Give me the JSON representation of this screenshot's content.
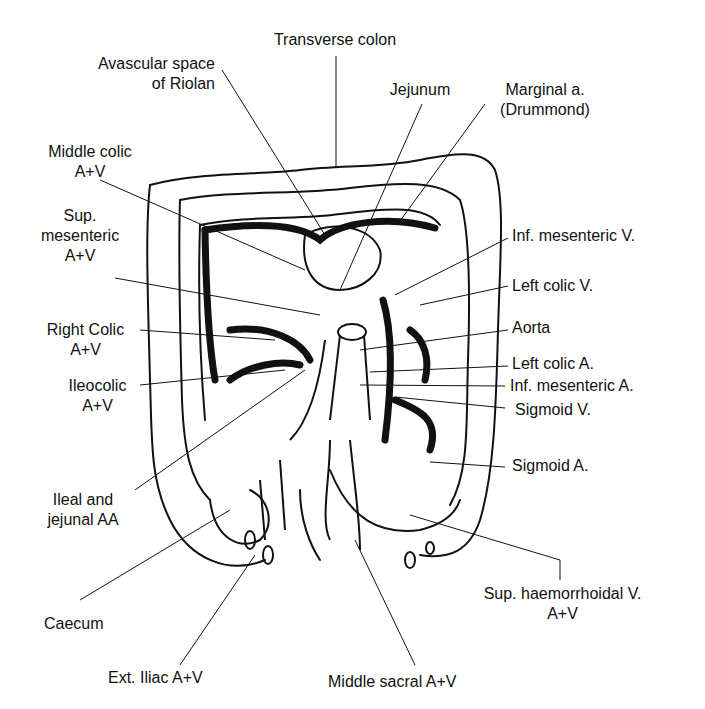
{
  "labels": {
    "transverse_colon": "Transverse colon",
    "avascular_space": [
      "Avascular space",
      "of Riolan"
    ],
    "jejunum": "Jejunum",
    "marginal_a": [
      "Marginal a.",
      "(Drummond)"
    ],
    "middle_colic": [
      "Middle colic",
      "A+V"
    ],
    "sup_mesenteric": [
      "Sup.",
      "mesenteric",
      "A+V"
    ],
    "right_colic": [
      "Right Colic",
      "A+V"
    ],
    "ileocolic": [
      "Ileocolic",
      "A+V"
    ],
    "ileal_jejunal": [
      "Ileal and",
      "jejunal AA"
    ],
    "caecum": "Caecum",
    "ext_iliac": "Ext. Iliac A+V",
    "middle_sacral": "Middle sacral A+V",
    "sup_haemorrhoidal": [
      "Sup. haemorrhoidal V.",
      "A+V"
    ],
    "inf_mesenteric_v": "Inf. mesenteric V.",
    "left_colic_v": "Left colic V.",
    "aorta": "Aorta",
    "left_colic_a": "Left colic A.",
    "inf_mesenteric_a": "Inf. mesenteric A.",
    "sigmoid_v": "Sigmoid V.",
    "sigmoid_a": "Sigmoid A."
  }
}
